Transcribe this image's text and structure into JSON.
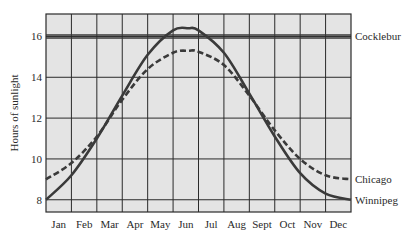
{
  "chart_data": {
    "type": "line",
    "title": "",
    "xlabel": "",
    "ylabel": "Hours of sunlight",
    "ylim": [
      7.4,
      17.1
    ],
    "yticks": [
      8,
      10,
      12,
      14,
      16
    ],
    "grid": true,
    "legend_position": "inline-right",
    "categories": [
      "Jan",
      "Feb",
      "Mar",
      "Apr",
      "May",
      "Jun",
      "Jul",
      "Aug",
      "Sept",
      "Oct",
      "Nov",
      "Dec"
    ],
    "x_note": "x spans start of Jan (0) to end of Dec (12); month labels centered in columns",
    "series": [
      {
        "name": "Cocklebur",
        "style": "double-solid",
        "x": [
          0,
          12
        ],
        "values": [
          16.0,
          16.0
        ]
      },
      {
        "name": "Winnipeg",
        "style": "solid",
        "x": [
          0,
          1,
          2,
          3,
          4,
          5,
          5.6,
          6,
          7,
          8,
          9,
          10,
          11,
          12
        ],
        "values": [
          8.0,
          9.2,
          11.0,
          13.1,
          15.1,
          16.3,
          16.4,
          16.3,
          15.2,
          13.2,
          11.1,
          9.3,
          8.3,
          8.0
        ]
      },
      {
        "name": "Chicago",
        "style": "dashed",
        "x": [
          0,
          1,
          2,
          3,
          4,
          5,
          5.6,
          6,
          7,
          8,
          9,
          10,
          11,
          12
        ],
        "values": [
          9.0,
          9.8,
          11.1,
          12.9,
          14.4,
          15.2,
          15.3,
          15.25,
          14.6,
          13.1,
          11.4,
          10.0,
          9.2,
          9.0
        ]
      }
    ]
  },
  "colors": {
    "plot_background": "#e4e4e4",
    "grid": "#2a2a2a",
    "line": "#3a3a3a",
    "text": "#2a2a2a"
  }
}
